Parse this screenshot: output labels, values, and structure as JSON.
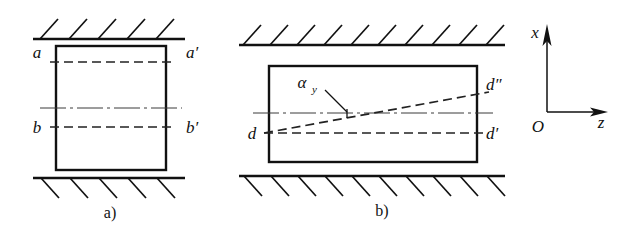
{
  "figure": {
    "background_color": "#ffffff",
    "line_color": "#111111",
    "centerline_color": "#3a3a3a"
  },
  "panel_a": {
    "caption": "a)",
    "labels": {
      "top_left": "a",
      "top_right": "a′",
      "bottom_left": "b",
      "bottom_right": "b′"
    }
  },
  "panel_b": {
    "caption": "b)",
    "labels": {
      "left": "d",
      "right_upper": "d″",
      "right_lower": "d′",
      "angle": "α",
      "angle_subscript": "y"
    }
  },
  "axes": {
    "vertical_label": "x",
    "horizontal_label": "z",
    "origin_label": "O"
  }
}
